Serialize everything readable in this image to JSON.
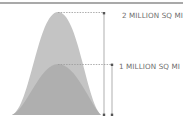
{
  "colors": {
    "rule": "#a9a9a9",
    "outer_fill": "#c2c2c2",
    "inner_fill": "#a9a9a9",
    "guide_line": "#8c8c8c",
    "label_text": "#6e6e6e"
  },
  "markers": [
    {
      "label": "2 MILLION SQ MI",
      "value_million_sq_mi": 2
    },
    {
      "label": "1 MILLION SQ MI",
      "value_million_sq_mi": 1
    }
  ]
}
